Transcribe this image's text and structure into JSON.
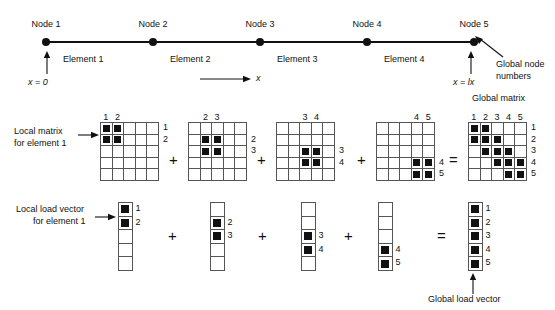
{
  "mesh": {
    "nodes": [
      {
        "label": "Node 1",
        "x": 46
      },
      {
        "label": "Node 2",
        "x": 153
      },
      {
        "label": "Node 3",
        "x": 260
      },
      {
        "label": "Node 4",
        "x": 367
      },
      {
        "label": "Node 5",
        "x": 474
      }
    ],
    "elements": [
      {
        "label": "Element 1",
        "x": 63
      },
      {
        "label": "Element 2",
        "x": 170
      },
      {
        "label": "Element 3",
        "x": 277
      },
      {
        "label": "Element 4",
        "x": 384
      }
    ],
    "left_coord": "x = 0",
    "right_coord": "x = lx",
    "axis_label": "x",
    "node_numbers_label_line1": "Global node",
    "node_numbers_label_line2": "numbers"
  },
  "matrix_row": {
    "caption_line1": "Local matrix",
    "caption_line2": "for element 1",
    "global_caption": "Global matrix",
    "plus": "+",
    "equals": "=",
    "items": [
      {
        "name": "element-1-matrix",
        "x": 100,
        "cols": [
          "1",
          "2"
        ],
        "col_offsets": [
          0,
          1
        ],
        "rows": [
          "1",
          "2"
        ],
        "row_offsets": [
          0,
          1
        ],
        "filled": [
          [
            0,
            0
          ],
          [
            0,
            1
          ],
          [
            1,
            0
          ],
          [
            1,
            1
          ]
        ]
      },
      {
        "name": "element-2-matrix",
        "x": 188,
        "cols": [
          "2",
          "3"
        ],
        "col_offsets": [
          1,
          2
        ],
        "rows": [
          "2",
          "3"
        ],
        "row_offsets": [
          1,
          2
        ],
        "filled": [
          [
            1,
            1
          ],
          [
            1,
            2
          ],
          [
            2,
            1
          ],
          [
            2,
            2
          ]
        ]
      },
      {
        "name": "element-3-matrix",
        "x": 276,
        "cols": [
          "3",
          "4"
        ],
        "col_offsets": [
          2,
          3
        ],
        "rows": [
          "3",
          "4"
        ],
        "row_offsets": [
          2,
          3
        ],
        "filled": [
          [
            2,
            2
          ],
          [
            2,
            3
          ],
          [
            3,
            2
          ],
          [
            3,
            3
          ]
        ]
      },
      {
        "name": "element-4-matrix",
        "x": 376,
        "cols": [
          "4",
          "5"
        ],
        "col_offsets": [
          3,
          4
        ],
        "rows": [
          "4",
          "5"
        ],
        "row_offsets": [
          3,
          4
        ],
        "filled": [
          [
            3,
            3
          ],
          [
            3,
            4
          ],
          [
            4,
            3
          ],
          [
            4,
            4
          ]
        ]
      }
    ],
    "global": {
      "name": "global-matrix",
      "x": 468,
      "cols": [
        "1",
        "2",
        "3",
        "4",
        "5"
      ],
      "col_offsets": [
        0,
        1,
        2,
        3,
        4
      ],
      "rows": [
        "1",
        "2",
        "3",
        "4",
        "5"
      ],
      "row_offsets": [
        0,
        1,
        2,
        3,
        4
      ],
      "filled": [
        [
          0,
          0
        ],
        [
          0,
          1
        ],
        [
          1,
          0
        ],
        [
          1,
          1
        ],
        [
          1,
          2
        ],
        [
          2,
          1
        ],
        [
          2,
          2
        ],
        [
          2,
          3
        ],
        [
          3,
          2
        ],
        [
          3,
          3
        ],
        [
          3,
          4
        ],
        [
          4,
          3
        ],
        [
          4,
          4
        ]
      ]
    },
    "operators": [
      {
        "sym": "+",
        "x": 169,
        "y": 152
      },
      {
        "sym": "+",
        "x": 257,
        "y": 152
      },
      {
        "sym": "+",
        "x": 357,
        "y": 152
      },
      {
        "sym": "=",
        "x": 449,
        "y": 152
      }
    ]
  },
  "vector_row": {
    "caption_line1": "Local load vector",
    "caption_line2": "for element 1",
    "global_caption": "Global load vector",
    "items": [
      {
        "name": "element-1-load-vector",
        "x": 118,
        "labels": [
          "1",
          "2"
        ],
        "label_offsets": [
          0,
          1
        ],
        "filled": [
          0,
          1
        ]
      },
      {
        "name": "element-2-load-vector",
        "x": 210,
        "labels": [
          "2",
          "3"
        ],
        "label_offsets": [
          1,
          2
        ],
        "filled": [
          1,
          2
        ]
      },
      {
        "name": "element-3-load-vector",
        "x": 301,
        "labels": [
          "3",
          "4"
        ],
        "label_offsets": [
          2,
          3
        ],
        "filled": [
          2,
          3
        ]
      },
      {
        "name": "element-4-load-vector",
        "x": 378,
        "labels": [
          "4",
          "5"
        ],
        "label_offsets": [
          3,
          4
        ],
        "filled": [
          3,
          4
        ]
      }
    ],
    "global": {
      "name": "global-load-vector",
      "x": 468,
      "labels": [
        "1",
        "2",
        "3",
        "4",
        "5"
      ],
      "label_offsets": [
        0,
        1,
        2,
        3,
        4
      ],
      "filled": [
        0,
        1,
        2,
        3,
        4
      ]
    },
    "operators": [
      {
        "sym": "+",
        "x": 168,
        "y": 228
      },
      {
        "sym": "+",
        "x": 258,
        "y": 228
      },
      {
        "sym": "+",
        "x": 344,
        "y": 228
      },
      {
        "sym": "=",
        "x": 437,
        "y": 228
      }
    ]
  },
  "colors": {
    "ink": "#111111",
    "grid_line": "#555555",
    "background": "#ffffff"
  }
}
